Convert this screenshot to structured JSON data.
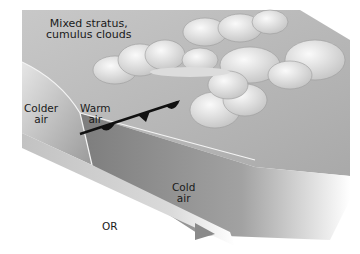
{
  "diagram": {
    "type": "occluded-front-cross-section",
    "labels": {
      "clouds": "Mixed stratus,\ncumulus clouds",
      "colder_air": "Colder\nair",
      "warm_air": "Warm\nair",
      "cold_air": "Cold\nair",
      "or": "OR"
    },
    "front_symbol": "occluded-front",
    "colors": {
      "background": "#ffffff",
      "upper_surface": "#b9b9b9",
      "colder_air_block": "#9c9c9c",
      "cold_air_wedge": "#8e8e8e",
      "side_face": "#d2d2d2",
      "front_line": "#111111",
      "cloud_fill": "#eeeeee"
    }
  }
}
